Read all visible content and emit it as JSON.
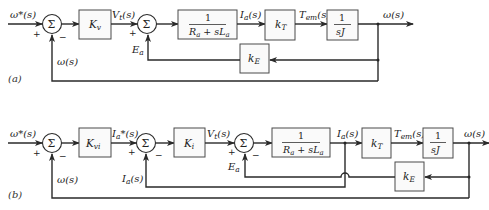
{
  "diagram_a": {
    "tag": "(a)",
    "signals": {
      "input": "ω*(s)",
      "vt": "V",
      "vt_sub": "t",
      "vt_arg": "(s)",
      "ia": "I",
      "ia_sub": "a",
      "ia_arg": "(s)",
      "tem": "T",
      "tem_sub": "em",
      "tem_arg": "(s)",
      "output": "ω(s)",
      "feedback_omega": "ω(s)",
      "ea": "E",
      "ea_sub": "a"
    },
    "blocks": {
      "kv": "K",
      "kv_sub": "v",
      "plant_num": "1",
      "plant_den": "R",
      "plant_den_sub1": "a",
      "plant_den_mid": " + sL",
      "plant_den_sub2": "a",
      "kt": "k",
      "kt_sub": "T",
      "inertia_num": "1",
      "inertia_den": "sJ",
      "ke": "k",
      "ke_sub": "E"
    },
    "summing": {
      "symbol": "Σ",
      "plus": "+",
      "minus": "−"
    }
  },
  "diagram_b": {
    "tag": "(b)",
    "signals": {
      "input": "ω*(s)",
      "ia_ref": "I",
      "ia_ref_sub": "a",
      "ia_ref_arg": "*(s)",
      "vt": "V",
      "vt_sub": "t",
      "vt_arg": "(s)",
      "ia": "I",
      "ia_sub": "a",
      "ia_arg": "(s)",
      "tem": "T",
      "tem_sub": "em",
      "tem_arg": "(s)",
      "output": "ω(s)",
      "feedback_omega": "ω(s)",
      "feedback_ia": "I",
      "feedback_ia_sub": "a",
      "feedback_ia_arg": "(s)",
      "ea": "E",
      "ea_sub": "a"
    },
    "blocks": {
      "kvi": "K",
      "kvi_sub": "vi",
      "ki": "K",
      "ki_sub": "i",
      "plant_num": "1",
      "plant_den": "R",
      "plant_den_sub1": "a",
      "plant_den_mid": " + sL",
      "plant_den_sub2": "a",
      "kt": "k",
      "kt_sub": "T",
      "inertia_num": "1",
      "inertia_den": "sJ",
      "ke": "k",
      "ke_sub": "E"
    },
    "summing": {
      "symbol": "Σ",
      "plus": "+",
      "minus": "−"
    }
  }
}
